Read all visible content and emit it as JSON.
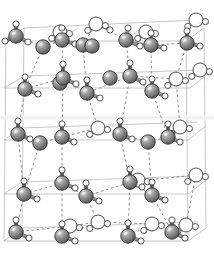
{
  "figure": {
    "type": "molecular-structure",
    "width": 214,
    "height": 259,
    "background": "#ffffff"
  },
  "legend": {
    "oxygen_label": "O",
    "hydrogen_label": "H",
    "water_label": "H2O"
  },
  "colors": {
    "background": "#ffffff",
    "oxygen_dark": "#7d7d7d",
    "oxygen_highlight": "#d8d8d8",
    "oxygen_shadow": "#4a4a4a",
    "oxygen_outline": "#2f2f2f",
    "hydrogen_fill": "#fbfbfb",
    "hydrogen_highlight": "#ffffff",
    "hydrogen_outline": "#3a3a3a",
    "water_fill": "#fdfdfd",
    "water_outline": "#444444",
    "bond_stick": "#9a9a9a",
    "bond_stick_edge": "#5a5a5a",
    "hbond_dash": "#8e8e8e",
    "cell_line": "#b9b9b9",
    "cell_line_faint": "#d5d5d5",
    "band_highlight": "#f2f2f2"
  },
  "geometry": {
    "oxygen_radius": 7.2,
    "hydrogen_radius": 3.1,
    "water_radius": 7.0,
    "stick_width": 2.6,
    "hbond_width": 1.0,
    "hbond_dash": "2.6 2.6",
    "cell_width": 0.8
  },
  "structure": {
    "layer_count": 4,
    "layer_y": [
      36,
      80,
      133,
      186,
      232
    ],
    "note": "four stacked puckered hexagonal bilayers viewed nearly edge-on"
  },
  "cell_lines": [
    {
      "name": "top-back-edge",
      "x1": 24,
      "y1": 28,
      "x2": 196,
      "y2": 20
    },
    {
      "name": "top-front-edge",
      "x1": 6,
      "y1": 41,
      "x2": 186,
      "y2": 41
    },
    {
      "name": "top-left-diag",
      "x1": 6,
      "y1": 41,
      "x2": 24,
      "y2": 28
    },
    {
      "name": "top-right-diag",
      "x1": 186,
      "y1": 41,
      "x2": 204,
      "y2": 28
    },
    {
      "name": "top-mid-diag-a",
      "x1": 60,
      "y1": 41,
      "x2": 78,
      "y2": 28
    },
    {
      "name": "top-mid-diag-b",
      "x1": 124,
      "y1": 41,
      "x2": 142,
      "y2": 28
    },
    {
      "name": "mid1-back-edge",
      "x1": 24,
      "y1": 76,
      "x2": 200,
      "y2": 70
    },
    {
      "name": "mid1-front-edge",
      "x1": 4,
      "y1": 88,
      "x2": 190,
      "y2": 88
    },
    {
      "name": "mid1-left-diag",
      "x1": 4,
      "y1": 88,
      "x2": 24,
      "y2": 76
    },
    {
      "name": "mid1-right-diag",
      "x1": 190,
      "y1": 88,
      "x2": 208,
      "y2": 74
    },
    {
      "name": "mid2-back-edge",
      "x1": 22,
      "y1": 128,
      "x2": 198,
      "y2": 122
    },
    {
      "name": "mid2-front-edge",
      "x1": 4,
      "y1": 140,
      "x2": 188,
      "y2": 140
    },
    {
      "name": "mid2-left-diag",
      "x1": 4,
      "y1": 140,
      "x2": 22,
      "y2": 128
    },
    {
      "name": "mid2-right-diag",
      "x1": 188,
      "y1": 140,
      "x2": 206,
      "y2": 126
    },
    {
      "name": "mid3-back-edge",
      "x1": 22,
      "y1": 182,
      "x2": 198,
      "y2": 176
    },
    {
      "name": "mid3-front-edge",
      "x1": 4,
      "y1": 194,
      "x2": 188,
      "y2": 194
    },
    {
      "name": "mid3-left-diag",
      "x1": 4,
      "y1": 194,
      "x2": 22,
      "y2": 182
    },
    {
      "name": "mid3-right-diag",
      "x1": 188,
      "y1": 194,
      "x2": 206,
      "y2": 180
    },
    {
      "name": "bot-back-edge",
      "x1": 22,
      "y1": 228,
      "x2": 198,
      "y2": 222
    },
    {
      "name": "bot-front-edge",
      "x1": 4,
      "y1": 241,
      "x2": 188,
      "y2": 241
    },
    {
      "name": "bot-left-diag",
      "x1": 4,
      "y1": 241,
      "x2": 22,
      "y2": 228
    },
    {
      "name": "bot-right-diag",
      "x1": 188,
      "y1": 241,
      "x2": 206,
      "y2": 228
    },
    {
      "name": "bot-mid-diag-a",
      "x1": 58,
      "y1": 241,
      "x2": 76,
      "y2": 228
    },
    {
      "name": "bot-mid-diag-b",
      "x1": 122,
      "y1": 241,
      "x2": 140,
      "y2": 228
    },
    {
      "name": "vert-left",
      "x1": 6,
      "y1": 41,
      "x2": 4,
      "y2": 241
    },
    {
      "name": "vert-right",
      "x1": 186,
      "y1": 41,
      "x2": 188,
      "y2": 241
    },
    {
      "name": "vert-back-left",
      "x1": 24,
      "y1": 28,
      "x2": 22,
      "y2": 228
    },
    {
      "name": "vert-back-right",
      "x1": 204,
      "y1": 28,
      "x2": 206,
      "y2": 228
    }
  ],
  "highlight_band": {
    "x": 0,
    "y": 113,
    "width": 214,
    "height": 9
  },
  "oxygens": [
    {
      "id": "O1",
      "x": 16,
      "y": 36
    },
    {
      "id": "O2",
      "x": 62,
      "y": 40
    },
    {
      "id": "O3",
      "x": 83,
      "y": 45
    },
    {
      "id": "O4",
      "x": 126,
      "y": 40
    },
    {
      "id": "O5",
      "x": 60,
      "y": 83
    },
    {
      "id": "O6",
      "x": 92,
      "y": 46
    },
    {
      "id": "O7",
      "x": 43,
      "y": 47
    },
    {
      "id": "O8",
      "x": 151,
      "y": 45
    },
    {
      "id": "O9",
      "x": 187,
      "y": 43
    },
    {
      "id": "O10",
      "x": 63,
      "y": 78
    },
    {
      "id": "O11",
      "x": 130,
      "y": 76
    },
    {
      "id": "O12",
      "x": 25,
      "y": 89
    },
    {
      "id": "O13",
      "x": 87,
      "y": 93
    },
    {
      "id": "O14",
      "x": 152,
      "y": 91
    },
    {
      "id": "O15",
      "x": 110,
      "y": 78
    },
    {
      "id": "O16",
      "x": 18,
      "y": 134
    },
    {
      "id": "O17",
      "x": 62,
      "y": 137
    },
    {
      "id": "O18",
      "x": 120,
      "y": 134
    },
    {
      "id": "O19",
      "x": 168,
      "y": 137
    },
    {
      "id": "O20",
      "x": 40,
      "y": 143
    },
    {
      "id": "O21",
      "x": 148,
      "y": 142
    },
    {
      "id": "O22",
      "x": 62,
      "y": 183
    },
    {
      "id": "O23",
      "x": 130,
      "y": 182
    },
    {
      "id": "O24",
      "x": 24,
      "y": 194
    },
    {
      "id": "O25",
      "x": 86,
      "y": 196
    },
    {
      "id": "O26",
      "x": 152,
      "y": 195
    },
    {
      "id": "O27",
      "x": 16,
      "y": 232
    },
    {
      "id": "O28",
      "x": 62,
      "y": 236
    },
    {
      "id": "O29",
      "x": 128,
      "y": 236
    },
    {
      "id": "O30",
      "x": 172,
      "y": 232
    }
  ],
  "waters": [
    {
      "id": "W1",
      "x": 96,
      "y": 24
    },
    {
      "id": "W2",
      "x": 196,
      "y": 20
    },
    {
      "id": "W3",
      "x": 146,
      "y": 32
    },
    {
      "id": "W4",
      "x": 60,
      "y": 32
    },
    {
      "id": "W5",
      "x": 176,
      "y": 79
    },
    {
      "id": "W6",
      "x": 200,
      "y": 70
    },
    {
      "id": "W7",
      "x": 98,
      "y": 128
    },
    {
      "id": "W8",
      "x": 180,
      "y": 127
    },
    {
      "id": "W9",
      "x": 196,
      "y": 175
    },
    {
      "id": "W10",
      "x": 138,
      "y": 180
    },
    {
      "id": "W11",
      "x": 98,
      "y": 222
    },
    {
      "id": "W12",
      "x": 186,
      "y": 225
    },
    {
      "id": "W13",
      "x": 70,
      "y": 226
    },
    {
      "id": "W14",
      "x": 152,
      "y": 224
    }
  ],
  "hydrogens": [
    {
      "id": "H1",
      "x": 16,
      "y": 24
    },
    {
      "id": "H2",
      "x": 5,
      "y": 41
    },
    {
      "id": "H3",
      "x": 28,
      "y": 42
    },
    {
      "id": "H4",
      "x": 62,
      "y": 28
    },
    {
      "id": "H5",
      "x": 75,
      "y": 44
    },
    {
      "id": "H6",
      "x": 110,
      "y": 30
    },
    {
      "id": "H7",
      "x": 128,
      "y": 28
    },
    {
      "id": "H8",
      "x": 140,
      "y": 46
    },
    {
      "id": "H9",
      "x": 151,
      "y": 33
    },
    {
      "id": "H10",
      "x": 164,
      "y": 48
    },
    {
      "id": "H11",
      "x": 187,
      "y": 31
    },
    {
      "id": "H12",
      "x": 200,
      "y": 46
    },
    {
      "id": "H13",
      "x": 63,
      "y": 64
    },
    {
      "id": "H14",
      "x": 76,
      "y": 84
    },
    {
      "id": "H15",
      "x": 130,
      "y": 63
    },
    {
      "id": "H16",
      "x": 143,
      "y": 82
    },
    {
      "id": "H17",
      "x": 25,
      "y": 77
    },
    {
      "id": "H18",
      "x": 38,
      "y": 94
    },
    {
      "id": "H19",
      "x": 87,
      "y": 80
    },
    {
      "id": "H20",
      "x": 100,
      "y": 98
    },
    {
      "id": "H21",
      "x": 152,
      "y": 79
    },
    {
      "id": "H22",
      "x": 165,
      "y": 96
    },
    {
      "id": "H23",
      "x": 18,
      "y": 121
    },
    {
      "id": "H24",
      "x": 30,
      "y": 139
    },
    {
      "id": "H25",
      "x": 62,
      "y": 124
    },
    {
      "id": "H26",
      "x": 74,
      "y": 142
    },
    {
      "id": "H27",
      "x": 120,
      "y": 121
    },
    {
      "id": "H28",
      "x": 132,
      "y": 139
    },
    {
      "id": "H29",
      "x": 168,
      "y": 124
    },
    {
      "id": "H30",
      "x": 180,
      "y": 142
    },
    {
      "id": "H31",
      "x": 62,
      "y": 170
    },
    {
      "id": "H32",
      "x": 75,
      "y": 188
    },
    {
      "id": "H33",
      "x": 130,
      "y": 169
    },
    {
      "id": "H34",
      "x": 142,
      "y": 187
    },
    {
      "id": "H35",
      "x": 24,
      "y": 181
    },
    {
      "id": "H36",
      "x": 37,
      "y": 199
    },
    {
      "id": "H37",
      "x": 86,
      "y": 183
    },
    {
      "id": "H38",
      "x": 99,
      "y": 201
    },
    {
      "id": "H39",
      "x": 152,
      "y": 182
    },
    {
      "id": "H40",
      "x": 165,
      "y": 200
    },
    {
      "id": "H41",
      "x": 16,
      "y": 220
    },
    {
      "id": "H42",
      "x": 29,
      "y": 238
    },
    {
      "id": "H43",
      "x": 62,
      "y": 224
    },
    {
      "id": "H44",
      "x": 75,
      "y": 241
    },
    {
      "id": "H45",
      "x": 128,
      "y": 223
    },
    {
      "id": "H46",
      "x": 141,
      "y": 241
    },
    {
      "id": "H47",
      "x": 172,
      "y": 220
    },
    {
      "id": "H48",
      "x": 185,
      "y": 238
    }
  ],
  "bonds": [
    {
      "a": "O1",
      "bx": 16,
      "by": 24
    },
    {
      "a": "O1",
      "bx": 5,
      "by": 41
    },
    {
      "a": "O1",
      "bx": 28,
      "by": 42
    },
    {
      "a": "O2",
      "bx": 62,
      "by": 28
    },
    {
      "a": "O2",
      "bx": 75,
      "by": 44
    },
    {
      "a": "O4",
      "bx": 128,
      "by": 28
    },
    {
      "a": "O4",
      "bx": 140,
      "by": 46
    },
    {
      "a": "O8",
      "bx": 151,
      "by": 33
    },
    {
      "a": "O8",
      "bx": 164,
      "by": 48
    },
    {
      "a": "O9",
      "bx": 187,
      "by": 31
    },
    {
      "a": "O9",
      "bx": 200,
      "by": 46
    },
    {
      "a": "O10",
      "bx": 63,
      "by": 64
    },
    {
      "a": "O10",
      "bx": 76,
      "by": 84
    },
    {
      "a": "O11",
      "bx": 130,
      "by": 63
    },
    {
      "a": "O11",
      "bx": 143,
      "by": 82
    },
    {
      "a": "O12",
      "bx": 25,
      "by": 77
    },
    {
      "a": "O12",
      "bx": 38,
      "by": 94
    },
    {
      "a": "O13",
      "bx": 87,
      "by": 80
    },
    {
      "a": "O13",
      "bx": 100,
      "by": 98
    },
    {
      "a": "O14",
      "bx": 152,
      "by": 79
    },
    {
      "a": "O14",
      "bx": 165,
      "by": 96
    },
    {
      "a": "O16",
      "bx": 18,
      "by": 121
    },
    {
      "a": "O16",
      "bx": 30,
      "by": 139
    },
    {
      "a": "O17",
      "bx": 62,
      "by": 124
    },
    {
      "a": "O17",
      "bx": 74,
      "by": 142
    },
    {
      "a": "O18",
      "bx": 120,
      "by": 121
    },
    {
      "a": "O18",
      "bx": 132,
      "by": 139
    },
    {
      "a": "O19",
      "bx": 168,
      "by": 124
    },
    {
      "a": "O19",
      "bx": 180,
      "by": 142
    },
    {
      "a": "O22",
      "bx": 62,
      "by": 170
    },
    {
      "a": "O22",
      "bx": 75,
      "by": 188
    },
    {
      "a": "O23",
      "bx": 130,
      "by": 169
    },
    {
      "a": "O23",
      "bx": 142,
      "by": 187
    },
    {
      "a": "O24",
      "bx": 24,
      "by": 181
    },
    {
      "a": "O24",
      "bx": 37,
      "by": 199
    },
    {
      "a": "O25",
      "bx": 86,
      "by": 183
    },
    {
      "a": "O25",
      "bx": 99,
      "by": 201
    },
    {
      "a": "O26",
      "bx": 152,
      "by": 182
    },
    {
      "a": "O26",
      "bx": 165,
      "by": 200
    },
    {
      "a": "O27",
      "bx": 16,
      "by": 220
    },
    {
      "a": "O27",
      "bx": 29,
      "by": 238
    },
    {
      "a": "O28",
      "bx": 62,
      "by": 224
    },
    {
      "a": "O28",
      "bx": 75,
      "by": 241
    },
    {
      "a": "O29",
      "bx": 128,
      "by": 223
    },
    {
      "a": "O29",
      "bx": 141,
      "by": 241
    },
    {
      "a": "O30",
      "bx": 172,
      "by": 220
    },
    {
      "a": "O30",
      "bx": 185,
      "by": 238
    }
  ],
  "hbonds": [
    {
      "x1": 16,
      "y1": 36,
      "x2": 43,
      "y2": 47
    },
    {
      "x1": 43,
      "y1": 47,
      "x2": 62,
      "y2": 40
    },
    {
      "x1": 62,
      "y1": 40,
      "x2": 83,
      "y2": 45
    },
    {
      "x1": 83,
      "y1": 45,
      "x2": 96,
      "y2": 24
    },
    {
      "x1": 96,
      "y1": 24,
      "x2": 126,
      "y2": 40
    },
    {
      "x1": 126,
      "y1": 40,
      "x2": 151,
      "y2": 45
    },
    {
      "x1": 151,
      "y1": 45,
      "x2": 187,
      "y2": 43
    },
    {
      "x1": 62,
      "y1": 40,
      "x2": 63,
      "y2": 78
    },
    {
      "x1": 126,
      "y1": 40,
      "x2": 130,
      "y2": 76
    },
    {
      "x1": 187,
      "y1": 43,
      "x2": 176,
      "y2": 79
    },
    {
      "x1": 43,
      "y1": 47,
      "x2": 25,
      "y2": 89
    },
    {
      "x1": 83,
      "y1": 45,
      "x2": 87,
      "y2": 93
    },
    {
      "x1": 151,
      "y1": 45,
      "x2": 152,
      "y2": 91
    },
    {
      "x1": 63,
      "y1": 78,
      "x2": 25,
      "y2": 89
    },
    {
      "x1": 63,
      "y1": 78,
      "x2": 87,
      "y2": 93
    },
    {
      "x1": 130,
      "y1": 76,
      "x2": 87,
      "y2": 93
    },
    {
      "x1": 130,
      "y1": 76,
      "x2": 152,
      "y2": 91
    },
    {
      "x1": 130,
      "y1": 76,
      "x2": 176,
      "y2": 79
    },
    {
      "x1": 63,
      "y1": 78,
      "x2": 62,
      "y2": 137
    },
    {
      "x1": 130,
      "y1": 76,
      "x2": 120,
      "y2": 134
    },
    {
      "x1": 25,
      "y1": 89,
      "x2": 18,
      "y2": 134
    },
    {
      "x1": 87,
      "y1": 93,
      "x2": 98,
      "y2": 128
    },
    {
      "x1": 152,
      "y1": 91,
      "x2": 168,
      "y2": 137
    },
    {
      "x1": 176,
      "y1": 79,
      "x2": 180,
      "y2": 127
    },
    {
      "x1": 18,
      "y1": 134,
      "x2": 40,
      "y2": 143
    },
    {
      "x1": 40,
      "y1": 143,
      "x2": 62,
      "y2": 137
    },
    {
      "x1": 62,
      "y1": 137,
      "x2": 98,
      "y2": 128
    },
    {
      "x1": 98,
      "y1": 128,
      "x2": 120,
      "y2": 134
    },
    {
      "x1": 120,
      "y1": 134,
      "x2": 148,
      "y2": 142
    },
    {
      "x1": 148,
      "y1": 142,
      "x2": 168,
      "y2": 137
    },
    {
      "x1": 168,
      "y1": 137,
      "x2": 180,
      "y2": 127
    },
    {
      "x1": 62,
      "y1": 137,
      "x2": 62,
      "y2": 183
    },
    {
      "x1": 120,
      "y1": 134,
      "x2": 130,
      "y2": 182
    },
    {
      "x1": 18,
      "y1": 134,
      "x2": 24,
      "y2": 194
    },
    {
      "x1": 148,
      "y1": 142,
      "x2": 152,
      "y2": 195
    },
    {
      "x1": 40,
      "y1": 143,
      "x2": 24,
      "y2": 194
    },
    {
      "x1": 62,
      "y1": 183,
      "x2": 24,
      "y2": 194
    },
    {
      "x1": 62,
      "y1": 183,
      "x2": 86,
      "y2": 196
    },
    {
      "x1": 86,
      "y1": 196,
      "x2": 138,
      "y2": 180
    },
    {
      "x1": 130,
      "y1": 182,
      "x2": 138,
      "y2": 180
    },
    {
      "x1": 130,
      "y1": 182,
      "x2": 152,
      "y2": 195
    },
    {
      "x1": 130,
      "y1": 182,
      "x2": 196,
      "y2": 175
    },
    {
      "x1": 62,
      "y1": 183,
      "x2": 62,
      "y2": 236
    },
    {
      "x1": 130,
      "y1": 182,
      "x2": 128,
      "y2": 236
    },
    {
      "x1": 24,
      "y1": 194,
      "x2": 16,
      "y2": 232
    },
    {
      "x1": 86,
      "y1": 196,
      "x2": 98,
      "y2": 222
    },
    {
      "x1": 152,
      "y1": 195,
      "x2": 172,
      "y2": 232
    },
    {
      "x1": 196,
      "y1": 175,
      "x2": 186,
      "y2": 225
    },
    {
      "x1": 16,
      "y1": 232,
      "x2": 70,
      "y2": 226
    },
    {
      "x1": 70,
      "y1": 226,
      "x2": 98,
      "y2": 222
    },
    {
      "x1": 62,
      "y1": 236,
      "x2": 98,
      "y2": 222
    },
    {
      "x1": 98,
      "y1": 222,
      "x2": 152,
      "y2": 224
    },
    {
      "x1": 128,
      "y1": 236,
      "x2": 152,
      "y2": 224
    },
    {
      "x1": 152,
      "y1": 224,
      "x2": 186,
      "y2": 225
    }
  ]
}
